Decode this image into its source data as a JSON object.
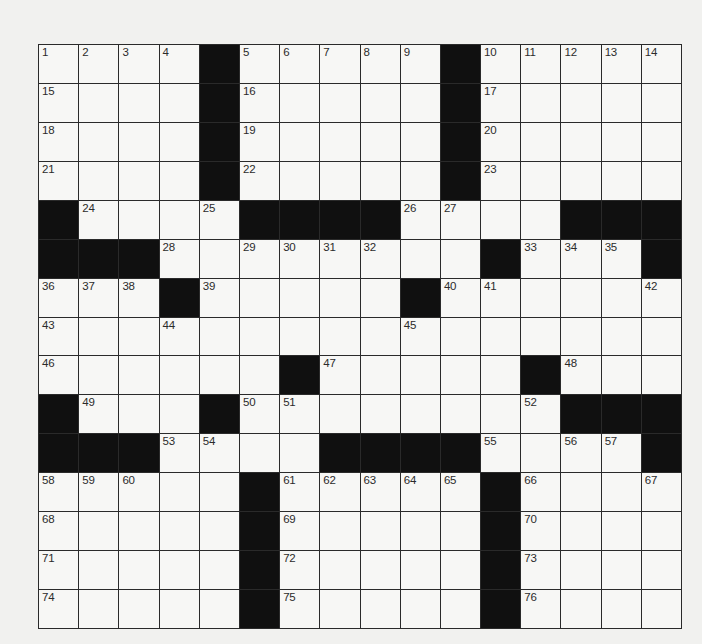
{
  "puzzle": {
    "type": "crossword",
    "cols": 16,
    "rows": 15,
    "colors": {
      "background": "#f1f1ef",
      "cell": "#f7f7f5",
      "block": "#101010",
      "line": "#2a2a2a",
      "number": "#2b2b2b"
    },
    "legend": "# = black square, . = empty white square, number = clue-numbered square",
    "grid": [
      [
        "1",
        "2",
        "3",
        "4",
        "#",
        "5",
        "6",
        "7",
        "8",
        "9",
        "#",
        "10",
        "11",
        "12",
        "13",
        "14"
      ],
      [
        "15",
        ".",
        ".",
        ".",
        "#",
        "16",
        ".",
        ".",
        ".",
        ".",
        "#",
        "17",
        ".",
        ".",
        ".",
        "."
      ],
      [
        "18",
        ".",
        ".",
        ".",
        "#",
        "19",
        ".",
        ".",
        ".",
        ".",
        "#",
        "20",
        ".",
        ".",
        ".",
        "."
      ],
      [
        "21",
        ".",
        ".",
        ".",
        "#",
        "22",
        ".",
        ".",
        ".",
        ".",
        "#",
        "23",
        ".",
        ".",
        ".",
        "."
      ],
      [
        "#",
        "24",
        ".",
        ".",
        "25",
        "#",
        "#",
        "#",
        "#",
        "26",
        "27",
        ".",
        ".",
        "#",
        "#",
        "#"
      ],
      [
        "#",
        "#",
        "#",
        "28",
        ".",
        "29",
        "30",
        "31",
        "32",
        ".",
        ".",
        "#",
        "33",
        "34",
        "35",
        "#"
      ],
      [
        "36",
        "37",
        "38",
        "#",
        "39",
        ".",
        ".",
        ".",
        ".",
        "#",
        "40",
        "41",
        ".",
        ".",
        ".",
        "42"
      ],
      [
        "43",
        ".",
        ".",
        "44",
        ".",
        ".",
        ".",
        ".",
        ".",
        "45",
        ".",
        ".",
        ".",
        ".",
        ".",
        "."
      ],
      [
        "46",
        ".",
        ".",
        ".",
        ".",
        ".",
        "#",
        "47",
        ".",
        ".",
        ".",
        ".",
        "#",
        "48",
        ".",
        "."
      ],
      [
        "#",
        "49",
        ".",
        ".",
        "#",
        "50",
        "51",
        ".",
        ".",
        ".",
        ".",
        ".",
        "52",
        "#",
        "#",
        "#"
      ],
      [
        "#",
        "#",
        "#",
        "53",
        "54",
        ".",
        ".",
        "#",
        "#",
        "#",
        "#",
        "55",
        ".",
        "56",
        "57",
        "#"
      ],
      [
        "58",
        "59",
        "60",
        ".",
        ".",
        "#",
        "61",
        "62",
        "63",
        "64",
        "65",
        "#",
        "66",
        ".",
        ".",
        "67"
      ],
      [
        "68",
        ".",
        ".",
        ".",
        ".",
        "#",
        "69",
        ".",
        ".",
        ".",
        ".",
        "#",
        "70",
        ".",
        ".",
        "."
      ],
      [
        "71",
        ".",
        ".",
        ".",
        ".",
        "#",
        "72",
        ".",
        ".",
        ".",
        ".",
        "#",
        "73",
        ".",
        ".",
        "."
      ],
      [
        "74",
        ".",
        ".",
        ".",
        ".",
        "#",
        "75",
        ".",
        ".",
        ".",
        ".",
        "#",
        "76",
        ".",
        ".",
        "."
      ]
    ]
  }
}
